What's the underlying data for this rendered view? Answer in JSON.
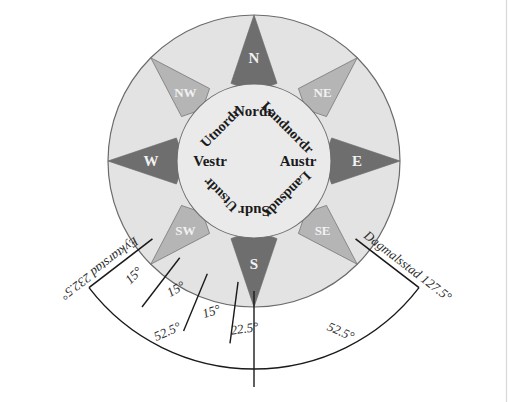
{
  "figure": {
    "background_color": "#ffffff",
    "outer_ring_color": "#e3e3e3",
    "inner_disc_color": "#eaeaea",
    "cardinal_point_color": "#6e6e6e",
    "intercardinal_point_color": "#b5b5b5",
    "outline_color": "#6b6b6b",
    "line_color": "#1a1a1a",
    "dark_text_color": "#1a1a1a",
    "white_text_color": "#f2f2f2"
  },
  "compass": {
    "center": {
      "x": 254,
      "y": 161
    },
    "outer_radius": 146,
    "inner_radius": 77,
    "cardinal_points": [
      {
        "abbr": "N",
        "bearing": 0,
        "style": "cardinal"
      },
      {
        "abbr": "NE",
        "bearing": 45,
        "style": "intercardinal"
      },
      {
        "abbr": "E",
        "bearing": 90,
        "style": "cardinal"
      },
      {
        "abbr": "SE",
        "bearing": 135,
        "style": "intercardinal"
      },
      {
        "abbr": "S",
        "bearing": 180,
        "style": "cardinal"
      },
      {
        "abbr": "SW",
        "bearing": 225,
        "style": "intercardinal"
      },
      {
        "abbr": "W",
        "bearing": 270,
        "style": "cardinal"
      },
      {
        "abbr": "NW",
        "bearing": 315,
        "style": "intercardinal"
      }
    ],
    "norse_names": [
      {
        "name": "Nordr",
        "bearing": 0
      },
      {
        "name": "Landnordr",
        "bearing": 45
      },
      {
        "name": "Austr",
        "bearing": 90
      },
      {
        "name": "Landsudr",
        "bearing": 135
      },
      {
        "name": "Sudr",
        "bearing": 180
      },
      {
        "name": "Utsudr",
        "bearing": 225
      },
      {
        "name": "Vestr",
        "bearing": 270
      },
      {
        "name": "Utnordr",
        "bearing": 315
      }
    ]
  },
  "annotations": {
    "left_station": "Eyktarstad 232.5°",
    "right_station": "Dagmalsstad 127.5°",
    "angles": [
      {
        "id": "a1",
        "text": "15°"
      },
      {
        "id": "a2",
        "text": "15°"
      },
      {
        "id": "a3",
        "text": "15°"
      },
      {
        "id": "a4",
        "text": "22.5°"
      },
      {
        "id": "arc_left",
        "text": "52.5°"
      },
      {
        "id": "arc_right",
        "text": "52.5°"
      }
    ]
  }
}
